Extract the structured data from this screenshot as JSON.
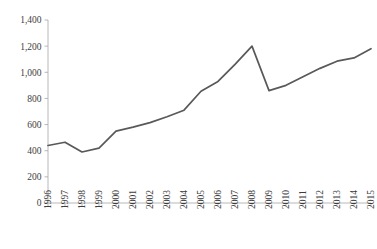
{
  "chart_data": {
    "type": "line",
    "title": "",
    "subtitle": "",
    "xlabel": "",
    "ylabel": "",
    "categories": [
      "1996",
      "1997",
      "1998",
      "1999",
      "2000",
      "2001",
      "2002",
      "2003",
      "2004",
      "2005",
      "2006",
      "2007",
      "2008",
      "2009",
      "2010",
      "2011",
      "2012",
      "2013",
      "2014",
      "2015"
    ],
    "series": [
      {
        "name": "",
        "values": [
          440,
          465,
          390,
          420,
          550,
          580,
          615,
          660,
          710,
          855,
          930,
          1060,
          1200,
          860,
          900,
          965,
          1030,
          1085,
          1110,
          1180
        ]
      }
    ],
    "ylim": [
      0,
      1400
    ],
    "yticks": [
      0,
      200,
      400,
      600,
      800,
      1000,
      1200,
      1400
    ],
    "ytick_labels": [
      "0",
      "200",
      "400",
      "600",
      "800",
      "1,000",
      "1,200",
      "1,400"
    ],
    "grid": false,
    "legend": "none",
    "line_color": "#595959",
    "axis_color": "#a6a6a6",
    "background_color": "#ffffff"
  }
}
